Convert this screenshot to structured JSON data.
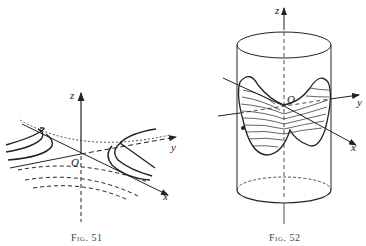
{
  "figures": [
    {
      "id": "fig51",
      "caption": "Fig. 51",
      "axis_labels": {
        "x": "x",
        "y": "y",
        "z": "z",
        "origin": "O"
      },
      "subject": "hyperbolic paraboloid level curves (saddle surface)"
    },
    {
      "id": "fig52",
      "caption": "Fig. 52",
      "axis_labels": {
        "x": "x",
        "y": "y",
        "z": "z",
        "origin": "O"
      },
      "subject": "saddle surface inside cylinder with contour lines"
    }
  ],
  "colors": {
    "ink": "#222222",
    "background": "#ffffff"
  }
}
